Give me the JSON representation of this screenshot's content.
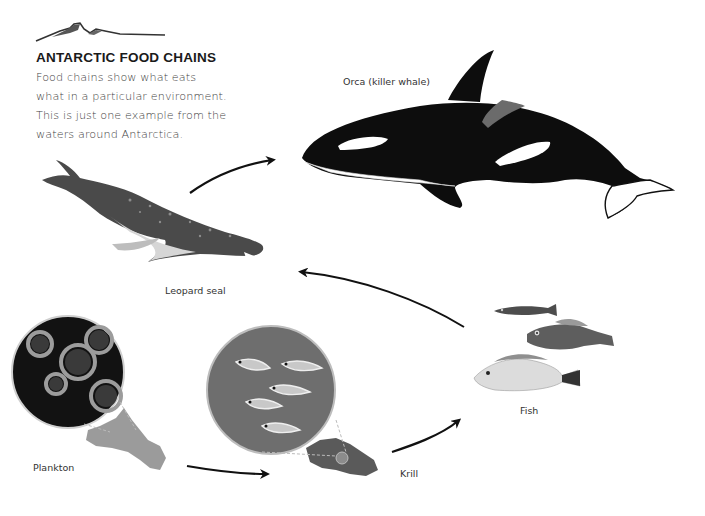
{
  "header": {
    "title": "ANTARCTIC FOOD CHAINS",
    "intro_lines": [
      "Food chains show what eats",
      "what in a particular environment.",
      "This is just one example from the",
      "waters around Antarctica."
    ],
    "icon": "mountain-icon"
  },
  "organisms": [
    {
      "id": "orca",
      "label": "Orca (killer whale)",
      "icon": "orca-illustration"
    },
    {
      "id": "leopard-seal",
      "label": "Leopard seal",
      "icon": "leopard-seal-illustration"
    },
    {
      "id": "fish",
      "label": "Fish",
      "icon": "fish-illustration"
    },
    {
      "id": "krill",
      "label": "Krill",
      "icon": "krill-illustration"
    },
    {
      "id": "plankton",
      "label": "Plankton",
      "icon": "plankton-illustration"
    }
  ],
  "chain": [
    {
      "from": "Plankton",
      "to": "Krill"
    },
    {
      "from": "Krill",
      "to": "Fish"
    },
    {
      "from": "Fish",
      "to": "Leopard seal"
    },
    {
      "from": "Leopard seal",
      "to": "Orca (killer whale)"
    }
  ],
  "colors": {
    "ink": "#111111",
    "text": "#444444",
    "orca_black": "#0d0d0d",
    "saddle_grey": "#6b6b6b",
    "background": "#ffffff"
  }
}
